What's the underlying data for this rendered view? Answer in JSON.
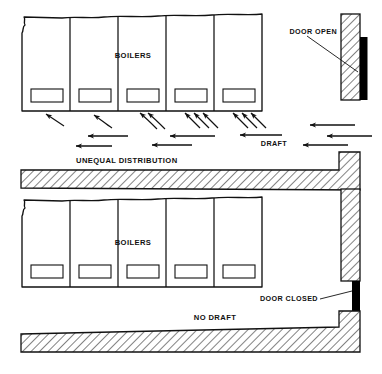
{
  "figure": {
    "type": "technical-diagram",
    "panels": [
      {
        "id": "top",
        "condition_label": "DOOR OPEN",
        "draft_label": "DRAFT",
        "distribution_label": "UNEQUAL DISTRIBUTION",
        "boilers_label": "BOILERS",
        "boiler_count": 5,
        "door_state": "open",
        "airflow": "air enters through open door and flows left along floor, entering boilers unevenly"
      },
      {
        "id": "bottom",
        "condition_label": "DOOR CLOSED",
        "draft_label": "NO DRAFT",
        "boilers_label": "BOILERS",
        "boiler_count": 5,
        "door_state": "closed",
        "airflow": "no air movement"
      }
    ]
  },
  "labels": {
    "door_open": "DOOR OPEN",
    "door_closed": "DOOR CLOSED",
    "draft": "DRAFT",
    "no_draft": "NO DRAFT",
    "unequal_distribution": "UNEQUAL DISTRIBUTION",
    "boilers_top": "BOILERS",
    "boilers_bottom": "BOILERS"
  },
  "colors": {
    "line": "#111111",
    "fill": "#ffffff",
    "door_solid": "#000000",
    "hatch": "#111111",
    "background": "#ffffff"
  }
}
